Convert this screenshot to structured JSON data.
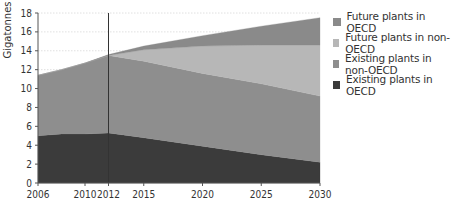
{
  "chart_data": {
    "type": "area",
    "stacked": true,
    "title": "",
    "xlabel": "",
    "ylabel": "Gigatonnes",
    "ylim": [
      0,
      18
    ],
    "xlim": [
      2006,
      2030
    ],
    "y_ticks": [
      0,
      2,
      4,
      6,
      8,
      10,
      12,
      14,
      16,
      18
    ],
    "x_ticks": [
      2006,
      2010,
      2012,
      2015,
      2020,
      2025,
      2030
    ],
    "grid": "horizontal dotted",
    "annotations": [
      {
        "type": "vertical-line",
        "x": 2012
      }
    ],
    "legend_position": "right",
    "x": [
      2006,
      2008,
      2010,
      2012,
      2015,
      2020,
      2025,
      2030
    ],
    "series": [
      {
        "name": "Existing plants in OECD",
        "color": "#3b3b3b",
        "values": [
          5.0,
          5.2,
          5.2,
          5.3,
          4.8,
          3.9,
          3.0,
          2.2
        ]
      },
      {
        "name": "Existing plants in non-OECD",
        "color": "#8e8e8e",
        "values": [
          6.4,
          6.8,
          7.5,
          8.2,
          8.1,
          7.7,
          7.5,
          7.0
        ]
      },
      {
        "name": "Future plants in non-OECD",
        "color": "#b7b7b7",
        "values": [
          0,
          0,
          0,
          0,
          1.2,
          2.9,
          4.1,
          5.4
        ]
      },
      {
        "name": "Future plants in OECD",
        "color": "#8a8a8a",
        "values": [
          0,
          0,
          0,
          0.1,
          0.4,
          1.1,
          2.0,
          2.9
        ]
      }
    ]
  },
  "legend": {
    "items": [
      {
        "label": "Future plants in OECD",
        "color": "#8a8a8a"
      },
      {
        "label": "Future plants in non-OECD",
        "color": "#b7b7b7"
      },
      {
        "label": "Existing plants in non-OECD",
        "color": "#8e8e8e"
      },
      {
        "label": "Existing plants in OECD",
        "color": "#3b3b3b"
      }
    ]
  }
}
